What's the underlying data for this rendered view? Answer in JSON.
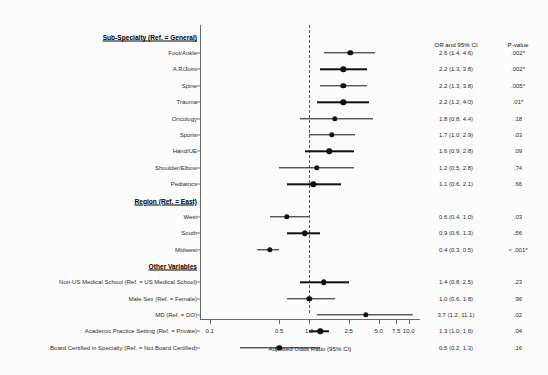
{
  "figure": {
    "axis_title": "Adjusted Odds Ratio (95% CI)",
    "or_header": "OR and 95% CI",
    "p_header": "P-value"
  },
  "chart_data": {
    "type": "forest",
    "title": "",
    "xlabel": "Adjusted Odds Ratio (95% CI)",
    "ylabel": "",
    "xscale": "log",
    "xlim": [
      0.08,
      13.0
    ],
    "xticks": [
      0.1,
      0.5,
      1.0,
      2.5,
      5.0,
      7.5,
      10.0
    ],
    "xticklabels": [
      "0.1",
      "0.5",
      "1.0",
      "2.5",
      "5.0",
      "7.5",
      "10.0"
    ],
    "reference_line": 1.0,
    "grid": false,
    "legend": "none",
    "groups": [
      {
        "header": "Sub-Specialty (Ref. = General)",
        "rows": [
          {
            "label": "Foot/Ankle",
            "or": 2.6,
            "lo": 1.4,
            "hi": 4.6,
            "or_text": "2.6 (1.4, 4.6)",
            "p_text": ".002*"
          },
          {
            "label": "A.R/Joint",
            "or": 2.2,
            "lo": 1.3,
            "hi": 3.8,
            "or_text": "2.2 (1.3, 3.8)",
            "p_text": ".002*"
          },
          {
            "label": "Spine",
            "or": 2.2,
            "lo": 1.3,
            "hi": 3.8,
            "or_text": "2.2 (1.3, 3.8)",
            "p_text": ".005*"
          },
          {
            "label": "Trauma",
            "or": 2.2,
            "lo": 1.2,
            "hi": 4.0,
            "or_text": "2.2 (1.2, 4.0)",
            "p_text": ".01*"
          },
          {
            "label": "Oncology",
            "or": 1.8,
            "lo": 0.8,
            "hi": 4.4,
            "or_text": "1.8 (0.8, 4.4)",
            "p_text": ".18"
          },
          {
            "label": "Sports",
            "or": 1.7,
            "lo": 1.0,
            "hi": 2.9,
            "or_text": "1.7 (1.0, 2.9)",
            "p_text": ".03"
          },
          {
            "label": "Hand/UE",
            "or": 1.6,
            "lo": 0.9,
            "hi": 2.8,
            "or_text": "1.6 (0.9, 2.8)",
            "p_text": ".09"
          },
          {
            "label": "Shoulder/Elbow",
            "or": 1.2,
            "lo": 0.5,
            "hi": 2.8,
            "or_text": "1.2 (0.5, 2.8)",
            "p_text": ".74"
          },
          {
            "label": "Pediatrics",
            "or": 1.1,
            "lo": 0.6,
            "hi": 2.1,
            "or_text": "1.1 (0.6, 2.1)",
            "p_text": ".66"
          }
        ]
      },
      {
        "header": "Region (Ref. = East)",
        "rows": [
          {
            "label": "West",
            "or": 0.6,
            "lo": 0.4,
            "hi": 1.0,
            "or_text": "0.6 (0.4, 1.0)",
            "p_text": ".03"
          },
          {
            "label": "South",
            "or": 0.9,
            "lo": 0.6,
            "hi": 1.3,
            "or_text": "0.9 (0.6, 1.3)",
            "p_text": ".56"
          },
          {
            "label": "Midwest",
            "or": 0.4,
            "lo": 0.3,
            "hi": 0.5,
            "or_text": "0.4 (0.3, 0.5)",
            "p_text": "< .001*"
          }
        ]
      },
      {
        "header": "Other Variables",
        "rows": [
          {
            "label": "Non-US Medical School (Ref. = US Medical School)",
            "or": 1.4,
            "lo": 0.8,
            "hi": 2.5,
            "or_text": "1.4 (0.8, 2.5)",
            "p_text": ".23"
          },
          {
            "label": "Male Sex (Ref. = Female)",
            "or": 1.0,
            "lo": 0.6,
            "hi": 1.8,
            "or_text": "1.0 (0.6, 1.8)",
            "p_text": ".96"
          },
          {
            "label": "MD (Ref. = DO)",
            "or": 3.7,
            "lo": 1.2,
            "hi": 11.1,
            "or_text": "3.7 (1.2, 11.1)",
            "p_text": ".02"
          },
          {
            "label": "Academic Practice Setting (Ref. = Private)",
            "or": 1.3,
            "lo": 1.0,
            "hi": 1.6,
            "or_text": "1.3 (1.0, 1.6)",
            "p_text": ".04"
          },
          {
            "label": "Board Certified in Specialty (Ref. = Not Board Certified)",
            "or": 0.5,
            "lo": 0.2,
            "hi": 1.3,
            "or_text": "0.5 (0.2, 1.3)",
            "p_text": ".16"
          }
        ]
      }
    ]
  }
}
